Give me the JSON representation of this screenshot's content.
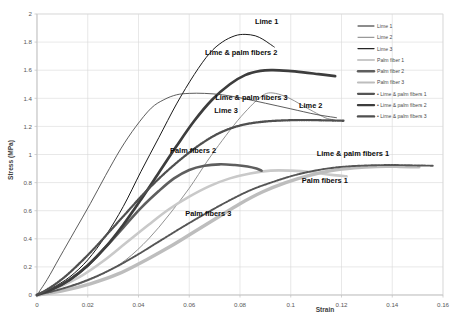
{
  "chart_data": {
    "type": "line",
    "title": "",
    "xlabel": "Strain",
    "ylabel": "Stress (MPa)",
    "xlim": [
      0,
      0.16
    ],
    "ylim": [
      0,
      2
    ],
    "grid": true,
    "legend_position": "right",
    "xticks": [
      "0",
      "0.02",
      "0.04",
      "0.06",
      "0.08",
      "0.1",
      "0.12",
      "0.14",
      "0.16"
    ],
    "xtick_values": [
      0,
      0.02,
      0.04,
      0.06,
      0.08,
      0.1,
      0.12,
      0.14,
      0.16
    ],
    "yticks": [
      "0",
      "0.2",
      "0.4",
      "0.6",
      "0.8",
      "1",
      "1.2",
      "1.4",
      "1.6",
      "1.8",
      "2"
    ],
    "ytick_values": [
      0,
      0.2,
      0.4,
      0.6,
      0.8,
      1,
      1.2,
      1.4,
      1.6,
      1.8,
      2
    ],
    "series": [
      {
        "name": "Lime 1",
        "color": "#1a1a1a",
        "width": 1.0,
        "dash": "none",
        "label_x": 0.0905,
        "label_y": 1.93,
        "x": [
          0,
          0.006,
          0.013,
          0.02,
          0.027,
          0.034,
          0.041,
          0.048,
          0.055,
          0.062,
          0.068,
          0.073,
          0.078,
          0.082,
          0.086,
          0.089,
          0.0915,
          0.0935
        ],
        "y": [
          0,
          0.05,
          0.13,
          0.25,
          0.42,
          0.63,
          0.88,
          1.12,
          1.36,
          1.57,
          1.72,
          1.8,
          1.845,
          1.855,
          1.845,
          1.82,
          1.79,
          1.765
        ]
      },
      {
        "name": "Lime 2",
        "color": "#808080",
        "width": 0.85,
        "dash": "none",
        "label_x": 0.1125,
        "label_y": 1.33,
        "x": [
          0,
          0.008,
          0.017,
          0.026,
          0.035,
          0.044,
          0.052,
          0.06,
          0.067,
          0.073,
          0.079,
          0.084,
          0.0875,
          0.0905,
          0.094,
          0.099,
          0.104,
          0.109,
          0.1135,
          0.1165
        ],
        "y": [
          0,
          0.03,
          0.08,
          0.15,
          0.25,
          0.4,
          0.57,
          0.76,
          0.95,
          1.1,
          1.24,
          1.34,
          1.4,
          1.435,
          1.435,
          1.405,
          1.355,
          1.305,
          1.262,
          1.248
        ]
      },
      {
        "name": "Lime 3",
        "color": "#404040",
        "width": 0.85,
        "dash": "none",
        "label_x": 0.0745,
        "label_y": 1.295,
        "x": [
          0,
          0.004,
          0.009,
          0.015,
          0.021,
          0.027,
          0.033,
          0.039,
          0.045,
          0.05,
          0.055,
          0.06,
          0.066,
          0.073,
          0.081,
          0.09,
          0.1,
          0.11,
          0.118
        ],
        "y": [
          0,
          0.11,
          0.27,
          0.46,
          0.65,
          0.85,
          1.04,
          1.2,
          1.33,
          1.39,
          1.425,
          1.435,
          1.435,
          1.425,
          1.4,
          1.365,
          1.325,
          1.285,
          1.262
        ]
      },
      {
        "name": "Palm fiber 1",
        "color": "#c9c9c9",
        "width": 2.6,
        "dash": "none",
        "label": "Palm fibers 1",
        "label_x": 0.1225,
        "label_y": 0.795,
        "x": [
          0,
          0.008,
          0.017,
          0.026,
          0.035,
          0.044,
          0.052,
          0.06,
          0.068,
          0.076,
          0.084,
          0.092,
          0.1,
          0.108,
          0.116,
          0.122
        ],
        "y": [
          0,
          0.05,
          0.13,
          0.24,
          0.37,
          0.5,
          0.61,
          0.7,
          0.775,
          0.83,
          0.865,
          0.885,
          0.885,
          0.875,
          0.855,
          0.845
        ]
      },
      {
        "name": "Palm fiber 2",
        "color": "#5e5e5e",
        "width": 2.6,
        "dash": "none",
        "label": "Palm fibers 2",
        "label_x": 0.0615,
        "label_y": 1.01,
        "x": [
          0,
          0.006,
          0.013,
          0.02,
          0.027,
          0.034,
          0.041,
          0.048,
          0.054,
          0.06,
          0.066,
          0.072,
          0.078,
          0.083,
          0.0865,
          0.0885
        ],
        "y": [
          0,
          0.04,
          0.11,
          0.21,
          0.34,
          0.48,
          0.62,
          0.74,
          0.83,
          0.89,
          0.92,
          0.93,
          0.925,
          0.915,
          0.9,
          0.885
        ]
      },
      {
        "name": "Palm fiber 3",
        "color": "#bdbdbd",
        "width": 3.4,
        "dash": "none",
        "label": "Palm fibers 3",
        "label_x": 0.0675,
        "label_y": 0.565,
        "x": [
          0,
          0.01,
          0.021,
          0.032,
          0.043,
          0.053,
          0.062,
          0.071,
          0.08,
          0.089,
          0.098,
          0.107,
          0.116,
          0.125,
          0.134,
          0.143,
          0.1505
        ],
        "y": [
          0,
          0.03,
          0.08,
          0.15,
          0.25,
          0.35,
          0.45,
          0.55,
          0.65,
          0.735,
          0.8,
          0.85,
          0.885,
          0.905,
          0.915,
          0.915,
          0.912
        ]
      },
      {
        "name": "Lime & palm fibers 1",
        "color": "#555555",
        "width": 1.9,
        "dash": "2.2,1.1",
        "label_x": 0.1245,
        "label_y": 0.99,
        "x": [
          0,
          0.009,
          0.019,
          0.029,
          0.039,
          0.048,
          0.057,
          0.066,
          0.075,
          0.084,
          0.093,
          0.102,
          0.111,
          0.12,
          0.13,
          0.14,
          0.1505,
          0.156
        ],
        "y": [
          0,
          0.04,
          0.1,
          0.18,
          0.28,
          0.38,
          0.48,
          0.575,
          0.665,
          0.745,
          0.805,
          0.855,
          0.89,
          0.912,
          0.922,
          0.925,
          0.922,
          0.92
        ]
      },
      {
        "name": "Lime & palm fibers 2",
        "color": "#3d3d3d",
        "width": 2.7,
        "dash": "none",
        "label_x": 0.0805,
        "label_y": 1.705,
        "x": [
          0,
          0.006,
          0.013,
          0.02,
          0.027,
          0.034,
          0.041,
          0.048,
          0.055,
          0.062,
          0.069,
          0.076,
          0.082,
          0.088,
          0.093,
          0.099,
          0.105,
          0.111,
          0.1175
        ],
        "y": [
          0,
          0.04,
          0.11,
          0.21,
          0.34,
          0.5,
          0.68,
          0.87,
          1.06,
          1.24,
          1.39,
          1.5,
          1.565,
          1.595,
          1.6,
          1.595,
          1.585,
          1.572,
          1.558
        ]
      },
      {
        "name": "Lime & palm fibers 3",
        "color": "#4f4f4f",
        "width": 2.3,
        "dash": "1.4,1.0",
        "label_x": 0.0845,
        "label_y": 1.385,
        "x": [
          0,
          0.005,
          0.011,
          0.017,
          0.023,
          0.029,
          0.035,
          0.041,
          0.047,
          0.053,
          0.059,
          0.065,
          0.071,
          0.077,
          0.083,
          0.09,
          0.098,
          0.106,
          0.114,
          0.121
        ],
        "y": [
          0,
          0.05,
          0.13,
          0.23,
          0.34,
          0.46,
          0.58,
          0.7,
          0.81,
          0.91,
          1.0,
          1.08,
          1.145,
          1.19,
          1.218,
          1.235,
          1.243,
          1.245,
          1.243,
          1.24
        ]
      }
    ],
    "legend": [
      {
        "label": "Lime 1",
        "color": "#1a1a1a",
        "width": 1.0,
        "dash": "none"
      },
      {
        "label": "Lime 2",
        "color": "#808080",
        "width": 1.0,
        "dash": "none"
      },
      {
        "label": "Lime 3",
        "color": "#262626",
        "width": 1.3,
        "dash": "none"
      },
      {
        "label": "Palm fiber 1",
        "color": "#c9c9c9",
        "width": 2.0,
        "dash": "none"
      },
      {
        "label": "Palm fiber 2",
        "color": "#5e5e5e",
        "width": 2.4,
        "dash": "none"
      },
      {
        "label": "Palm fiber 3",
        "color": "#bdbdbd",
        "width": 2.2,
        "dash": "none"
      },
      {
        "label": "Lime & palm fibers 1",
        "color": "#555555",
        "width": 2.2,
        "dash": "none"
      },
      {
        "label": "Lime & palm fibers 2",
        "color": "#3d3d3d",
        "width": 2.4,
        "dash": "none"
      },
      {
        "label": "Lime & palm fibers 3",
        "color": "#4f4f4f",
        "width": 2.4,
        "dash": "none"
      }
    ]
  }
}
